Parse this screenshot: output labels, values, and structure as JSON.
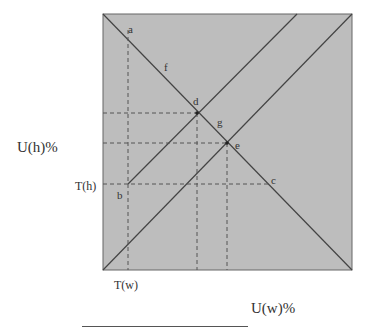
{
  "diagram": {
    "type": "utility-threshold diagram",
    "background_color": "#bdbdbd",
    "line_color": "#444444",
    "axis_labels": {
      "y": "U(h)%",
      "x": "U(w)%"
    },
    "threshold_labels": {
      "th": "T(h)",
      "tw": "T(w)"
    },
    "points": {
      "a": "a",
      "b": "b",
      "c": "c",
      "d": "d",
      "e": "e",
      "f": "f",
      "g": "g"
    }
  }
}
